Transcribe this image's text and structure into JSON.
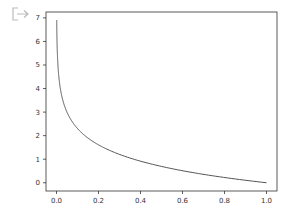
{
  "output_cell": {
    "icon": "output-arrow-icon"
  },
  "chart_data": {
    "type": "line",
    "title": "",
    "xlabel": "",
    "ylabel": "",
    "xlim": [
      -0.05,
      1.05
    ],
    "ylim": [
      -0.35,
      7.25
    ],
    "grid": false,
    "legend": null,
    "x_ticks": [
      "0.0",
      "0.2",
      "0.4",
      "0.6",
      "0.8",
      "1.0"
    ],
    "y_ticks": [
      "0",
      "1",
      "2",
      "3",
      "4",
      "5",
      "6",
      "7"
    ],
    "series": [
      {
        "name": "-ln(x)",
        "color": "#555555",
        "x": [
          0.001,
          0.005,
          0.01,
          0.02,
          0.03,
          0.05,
          0.075,
          0.1,
          0.15,
          0.2,
          0.25,
          0.3,
          0.4,
          0.5,
          0.6,
          0.7,
          0.8,
          0.9,
          1.0
        ],
        "y": [
          6.91,
          5.3,
          4.61,
          3.91,
          3.51,
          3.0,
          2.59,
          2.3,
          1.9,
          1.61,
          1.39,
          1.2,
          0.92,
          0.69,
          0.51,
          0.36,
          0.22,
          0.11,
          0.0
        ]
      }
    ]
  }
}
